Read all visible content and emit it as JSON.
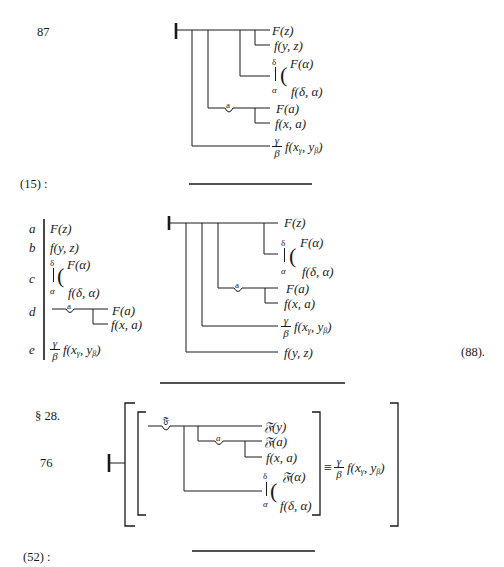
{
  "formula_87": {
    "number": "87",
    "conclusion": "F(z)",
    "conditions": {
      "c1": "f(y, z)",
      "c2_top_var": "δ",
      "c2_bottom_var": "α",
      "c2_upper": "F(α)",
      "c2_lower": "f(δ, α)",
      "c3_concavity_var": "a",
      "c3_upper": "F(a)",
      "c3_lower": "f(x, a)",
      "c4_frac_top": "γ",
      "c4_frac_bottom": "β",
      "c4_expr": "f(x",
      "c4_sub1": "γ",
      "c4_mid": ", y",
      "c4_sub2": "β",
      "c4_end": ")"
    }
  },
  "reference_15": "(15) :",
  "derivation": {
    "labels": [
      "a",
      "b",
      "c",
      "d",
      "e"
    ],
    "a": "F(z)",
    "b": "f(y, z)",
    "c_top_var": "δ",
    "c_bottom_var": "α",
    "c_upper": "F(α)",
    "c_lower": "f(δ, α)",
    "d_concavity_var": "a",
    "d_upper": "F(a)",
    "d_lower": "f(x, a)",
    "e_frac_top": "γ",
    "e_frac_bottom": "β",
    "e_expr": "f(x",
    "e_sub1": "γ",
    "e_mid": ", y",
    "e_sub2": "β",
    "e_end": ")"
  },
  "formula_88": {
    "number": "(88).",
    "conclusion": "F(z)",
    "c2_top_var": "δ",
    "c2_bottom_var": "α",
    "c2_upper": "F(α)",
    "c2_lower": "f(δ, α)",
    "c3_concavity_var": "a",
    "c3_upper": "F(a)",
    "c3_lower": "f(x, a)",
    "c4_frac_top": "γ",
    "c4_frac_bottom": "β",
    "c4_expr": "f(x",
    "c4_sub1": "γ",
    "c4_mid": ", y",
    "c4_sub2": "β",
    "c4_end": ")",
    "c5": "f(y, z)"
  },
  "section": "§ 28.",
  "formula_76": {
    "number": "76",
    "outer_concavity_var": "𝔉",
    "conclusion": "𝔉(y)",
    "inner_concavity_var": "a",
    "inner_upper": "𝔉(a)",
    "inner_lower": "f(x, a)",
    "cond_top_var": "δ",
    "cond_bottom_var": "α",
    "cond_upper": "𝔉(α)",
    "cond_lower": "f(δ, α)",
    "equiv": "≡",
    "rhs_frac_top": "γ",
    "rhs_frac_bottom": "β",
    "rhs_expr": "f(x",
    "rhs_sub1": "γ",
    "rhs_mid": ", y",
    "rhs_sub2": "β",
    "rhs_end": ")"
  },
  "reference_52": "(52) :"
}
